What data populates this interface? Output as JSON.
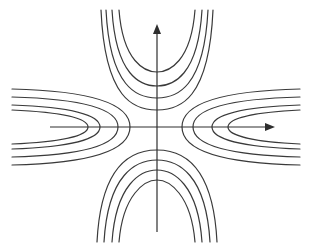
{
  "diagram": {
    "type": "saddle-phase-portrait",
    "colors": {
      "background": "#ffffff",
      "stroke": "#3a3a3a",
      "axis": "#2e2e2e"
    },
    "center": {
      "x": 157,
      "y": 127
    },
    "axes": {
      "vertical": {
        "x": 157,
        "y_top": 26,
        "y_bottom": 232,
        "arrow": "up"
      },
      "horizontal": {
        "y": 127,
        "x_left": 50,
        "x_right": 273,
        "arrow": "right"
      }
    },
    "lobes": {
      "top": [
        {
          "vertex_y": 72,
          "half_width_top": 20
        },
        {
          "vertex_y": 86,
          "half_width_top": 27
        },
        {
          "vertex_y": 98,
          "half_width_top": 33
        },
        {
          "vertex_y": 110,
          "half_width_top": 38
        }
      ],
      "bottom": [
        {
          "vertex_y": 180,
          "half_width_bottom": 20
        },
        {
          "vertex_y": 170,
          "half_width_bottom": 27
        },
        {
          "vertex_y": 160,
          "half_width_bottom": 35
        },
        {
          "vertex_y": 150,
          "half_width_bottom": 42
        }
      ],
      "left": [
        {
          "vertex_x": 88,
          "half_height_end": 17
        },
        {
          "vertex_x": 100,
          "half_height_end": 22
        },
        {
          "vertex_x": 118,
          "half_height_end": 30
        },
        {
          "vertex_x": 130,
          "half_height_end": 38
        }
      ],
      "right": [
        {
          "vertex_x": 228,
          "half_height_end": 17
        },
        {
          "vertex_x": 212,
          "half_height_end": 22
        },
        {
          "vertex_x": 193,
          "half_height_end": 30
        },
        {
          "vertex_x": 182,
          "half_height_end": 38
        }
      ]
    }
  }
}
